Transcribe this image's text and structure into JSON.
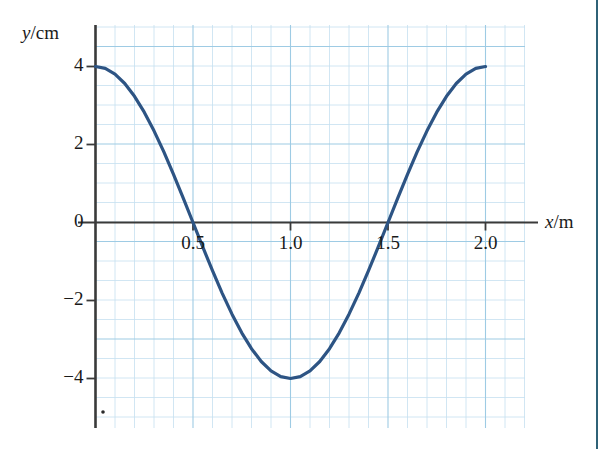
{
  "chart_data": {
    "type": "line",
    "title": "",
    "subtitle": "",
    "xlabel": "x/m",
    "ylabel": "y/cm",
    "xlabel_parts": {
      "symbol": "x",
      "unit": "/m"
    },
    "ylabel_parts": {
      "symbol": "y",
      "unit": "/cm"
    },
    "xlim": [
      0,
      2.2
    ],
    "ylim": [
      -5,
      5
    ],
    "xticks": [
      0.5,
      1.0,
      1.5,
      2.0
    ],
    "xtick_labels": [
      "0.5",
      "1.0",
      "1.5",
      "2.0"
    ],
    "yticks": [
      4,
      2,
      0,
      -2,
      -4
    ],
    "ytick_labels": [
      "4",
      "2",
      "0",
      "−2",
      "−4"
    ],
    "grid": true,
    "grid_style": "graph-paper",
    "grid_minor_step_x": 0.1,
    "grid_minor_step_y": 0.5,
    "grid_major_every": 5,
    "legend": "none",
    "series": [
      {
        "name": "wave",
        "equation": "y = 4 cos(πx)",
        "amplitude_cm": 4,
        "wavelength_m": 2.0,
        "color": "#2d5484",
        "x": [
          0.0,
          0.05,
          0.1,
          0.15,
          0.2,
          0.25,
          0.3,
          0.35,
          0.4,
          0.45,
          0.5,
          0.55,
          0.6,
          0.65,
          0.7,
          0.75,
          0.8,
          0.85,
          0.9,
          0.95,
          1.0,
          1.05,
          1.1,
          1.15,
          1.2,
          1.25,
          1.3,
          1.35,
          1.4,
          1.45,
          1.5,
          1.55,
          1.6,
          1.65,
          1.7,
          1.75,
          1.8,
          1.85,
          1.9,
          1.95,
          2.0
        ],
        "y": [
          4.0,
          3.951,
          3.804,
          3.564,
          3.236,
          2.828,
          2.351,
          1.816,
          1.236,
          0.627,
          0.0,
          -0.627,
          -1.236,
          -1.816,
          -2.351,
          -2.828,
          -3.236,
          -3.564,
          -3.804,
          -3.951,
          -4.0,
          -3.951,
          -3.804,
          -3.564,
          -3.236,
          -2.828,
          -2.351,
          -1.816,
          -1.236,
          -0.627,
          0.0,
          0.627,
          1.236,
          1.816,
          2.351,
          2.828,
          3.236,
          3.564,
          3.804,
          3.951,
          4.0
        ]
      }
    ],
    "annotations": [
      {
        "name": "zero-crossing",
        "x": 0.5,
        "y": 0
      },
      {
        "name": "zero-crossing",
        "x": 1.5,
        "y": 0
      },
      {
        "name": "minimum",
        "x": 1.0,
        "y": -4
      },
      {
        "name": "maximum",
        "x": 0.0,
        "y": 4
      },
      {
        "name": "maximum",
        "x": 2.0,
        "y": 4
      }
    ]
  },
  "colors": {
    "curve": "#2d5484",
    "grid_minor": "#c5dff0",
    "grid_major": "#9ecbe4",
    "axis": "#3a3a3a",
    "text": "#1a1a1a",
    "right_rule": "#2f6277"
  }
}
